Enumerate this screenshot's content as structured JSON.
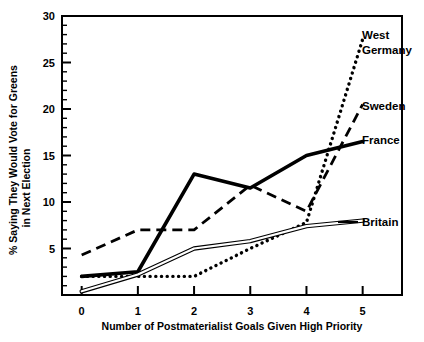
{
  "chart_data": {
    "type": "line",
    "title": "",
    "xlabel": "Number of Postmaterialist Goals Given High Priority",
    "ylabel": "% Saying They Would Vote for Greens in Next Election",
    "ylabel_line1": "% Saying They Would Vote for Greens",
    "ylabel_line2": "in Next Election",
    "x": [
      0,
      1,
      2,
      3,
      4,
      5
    ],
    "xlim": [
      -0.35,
      5.7
    ],
    "ylim": [
      0,
      30
    ],
    "yticks": [
      0,
      5,
      10,
      15,
      20,
      25,
      30
    ],
    "ytick_labels": [
      "",
      "5",
      "10",
      "15",
      "20",
      "25",
      "30"
    ],
    "xtick_labels": [
      "0",
      "1",
      "2",
      "3",
      "4",
      "5"
    ],
    "y_minor_tick_step": 1,
    "grid": false,
    "legend_position": "right-inline",
    "series": [
      {
        "name": "West Germany",
        "label": "West Germany",
        "label_line1": "West",
        "label_line2": "Germany",
        "style": "dotted",
        "color": "#000000",
        "values": [
          2.0,
          2.0,
          2.0,
          5.0,
          7.8,
          27.5
        ]
      },
      {
        "name": "Sweden",
        "label": "Sweden",
        "style": "dashed",
        "color": "#000000",
        "values": [
          4.3,
          7.0,
          7.0,
          11.8,
          9.0,
          20.5
        ]
      },
      {
        "name": "France",
        "label": "France",
        "style": "solid",
        "color": "#000000",
        "values": [
          2.0,
          2.5,
          13.0,
          11.5,
          15.0,
          16.5
        ]
      },
      {
        "name": "Britain",
        "label": "Britain",
        "style": "thin-double",
        "color": "#000000",
        "values": [
          0.4,
          2.2,
          5.0,
          5.8,
          7.4,
          8.0
        ]
      }
    ]
  },
  "axis_frame": {
    "border_color": "#000000"
  }
}
